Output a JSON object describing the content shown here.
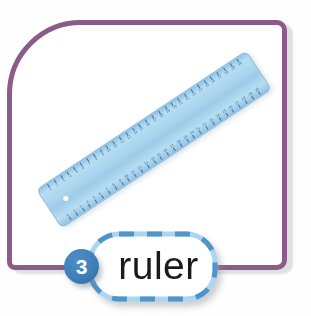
{
  "page": {
    "background": "#ffffff"
  },
  "card": {
    "frame_color": "#8b5b89"
  },
  "ruler_object": {
    "name": "ruler",
    "body_color": "#a9d4ee",
    "body_color_light": "#b7def2",
    "edge_color": "#85b6da",
    "marking_color": "#3c6f9f",
    "unit_count": 30,
    "has_hole": true
  },
  "label": {
    "number": "3",
    "word": "ruler",
    "circle_color": "#3f7fb8",
    "circle_text_color": "#ffffff",
    "pill_fill": "#ffffff",
    "pill_dash_dark": "#4f94ca",
    "pill_dash_light": "#abd6ef",
    "word_color": "#1b1b1b"
  }
}
